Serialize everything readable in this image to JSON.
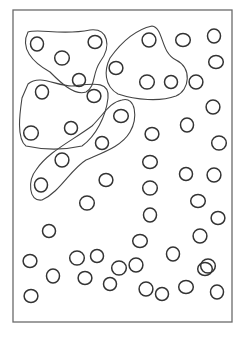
{
  "colors": {
    "ink": "#333333",
    "frame": "#6a6a6a",
    "background": "#ffffff"
  },
  "circle_count": 58,
  "group_count": 4,
  "groups": [
    {
      "name": "top-left-group",
      "member_count": 4
    },
    {
      "name": "top-center-group",
      "member_count": 4
    },
    {
      "name": "middle-left-group",
      "member_count": 4
    },
    {
      "name": "diagonal-group",
      "member_count": 4
    }
  ]
}
